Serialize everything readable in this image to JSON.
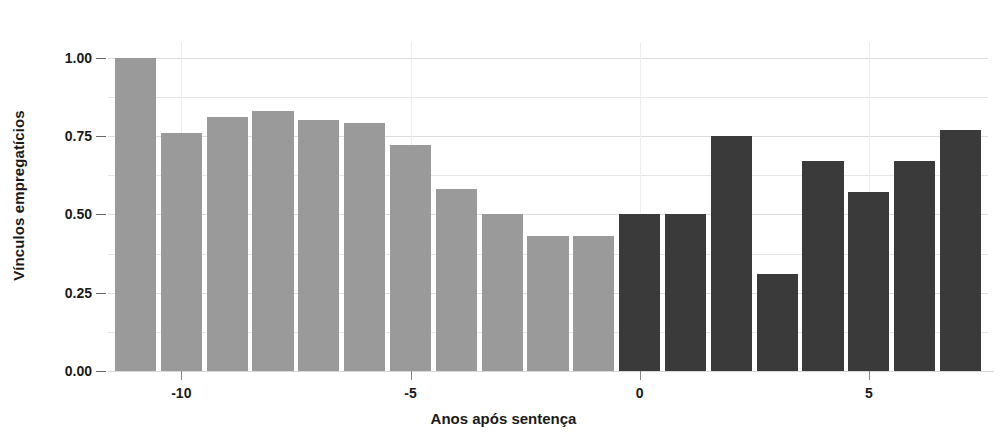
{
  "chart_data": {
    "type": "bar",
    "title": "",
    "xlabel": "Anos após sentença",
    "ylabel": "Vínculos empregatícios",
    "xlim": [
      -11.6,
      7.6
    ],
    "ylim": [
      0,
      1.05
    ],
    "grid": true,
    "legend": null,
    "x_ticks": [
      {
        "value": -10,
        "label": "-10"
      },
      {
        "value": -5,
        "label": "-5"
      },
      {
        "value": 0,
        "label": "0"
      },
      {
        "value": 5,
        "label": "5"
      }
    ],
    "y_ticks": [
      {
        "value": 0.0,
        "label": "0.00"
      },
      {
        "value": 0.25,
        "label": "0.25"
      },
      {
        "value": 0.5,
        "label": "0.50"
      },
      {
        "value": 0.75,
        "label": "0.75"
      },
      {
        "value": 1.0,
        "label": "1.00"
      }
    ],
    "y_minor_ticks": [
      0.125,
      0.375,
      0.625,
      0.875
    ],
    "colors": {
      "pre_sentence_bar": "#9a9a9a",
      "post_sentence_bar": "#3a3a3a",
      "gridline": "#e6e6e6",
      "axis_text": "#1a1a1a",
      "background": "#ffffff"
    },
    "categories": [
      -11,
      -10,
      -9,
      -8,
      -7,
      -6,
      -5,
      -4,
      -3,
      -2,
      -1,
      0,
      1,
      2,
      3,
      4,
      5,
      6,
      7
    ],
    "values": [
      1.0,
      0.76,
      0.81,
      0.83,
      0.8,
      0.79,
      0.72,
      0.58,
      0.5,
      0.43,
      0.43,
      0.5,
      0.5,
      0.75,
      0.31,
      0.67,
      0.57,
      0.67,
      0.77
    ],
    "bars": [
      {
        "x": -11,
        "value": 1.0,
        "group": "pre"
      },
      {
        "x": -10,
        "value": 0.76,
        "group": "pre"
      },
      {
        "x": -9,
        "value": 0.81,
        "group": "pre"
      },
      {
        "x": -8,
        "value": 0.83,
        "group": "pre"
      },
      {
        "x": -7,
        "value": 0.8,
        "group": "pre"
      },
      {
        "x": -6,
        "value": 0.79,
        "group": "pre"
      },
      {
        "x": -5,
        "value": 0.72,
        "group": "pre"
      },
      {
        "x": -4,
        "value": 0.58,
        "group": "pre"
      },
      {
        "x": -3,
        "value": 0.5,
        "group": "pre"
      },
      {
        "x": -2,
        "value": 0.43,
        "group": "pre"
      },
      {
        "x": -1,
        "value": 0.43,
        "group": "pre"
      },
      {
        "x": 0,
        "value": 0.5,
        "group": "post"
      },
      {
        "x": 1,
        "value": 0.5,
        "group": "post"
      },
      {
        "x": 2,
        "value": 0.75,
        "group": "post"
      },
      {
        "x": 3,
        "value": 0.31,
        "group": "post"
      },
      {
        "x": 4,
        "value": 0.67,
        "group": "post"
      },
      {
        "x": 5,
        "value": 0.57,
        "group": "post"
      },
      {
        "x": 6,
        "value": 0.67,
        "group": "post"
      },
      {
        "x": 7,
        "value": 0.77,
        "group": "post"
      }
    ]
  }
}
